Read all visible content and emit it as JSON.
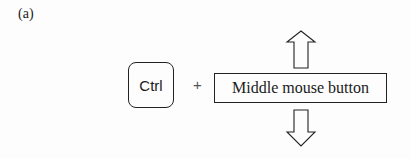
{
  "figure": {
    "panel_label": "(a)",
    "key": {
      "label": "Ctrl"
    },
    "operator": "+",
    "action": {
      "label": "Middle mouse button"
    },
    "arrows": [
      {
        "direction": "up",
        "icon": "arrow-up-outline-icon"
      },
      {
        "direction": "down",
        "icon": "arrow-down-outline-icon"
      }
    ],
    "colors": {
      "stroke": "#222222",
      "background": "#fdfdfd"
    }
  }
}
